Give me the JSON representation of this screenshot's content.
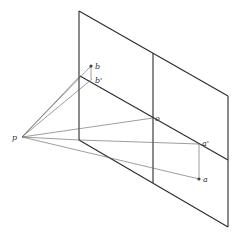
{
  "diagram": {
    "type": "perspective-projection",
    "colors": {
      "line": "#2a2a2a",
      "ray": "#5a5a5a",
      "background": "#ffffff"
    },
    "labels": {
      "p": "p",
      "b": "b",
      "b_prime": "b'",
      "o": "o",
      "a": "a",
      "a_prime": "a'"
    },
    "points": {
      "p": [
        22,
        137
      ],
      "b": [
        91,
        66
      ],
      "b_prime": [
        92,
        79
      ],
      "o": [
        153,
        118
      ],
      "a_prime": [
        199,
        144
      ],
      "a": [
        199,
        179
      ]
    }
  }
}
